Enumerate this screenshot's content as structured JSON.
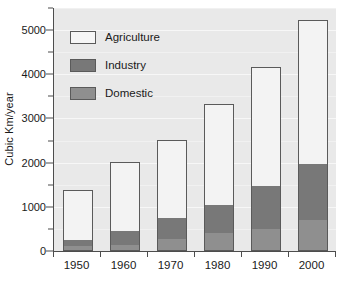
{
  "chart_data": {
    "type": "bar",
    "subtype": "stacked-bar",
    "title": "",
    "xlabel": "",
    "ylabel": "Cubic Km/year",
    "categories": [
      "1950",
      "1960",
      "1970",
      "1980",
      "1990",
      "2000"
    ],
    "series": [
      {
        "name": "Domestic",
        "color": "#8f8f8f",
        "values": [
          90,
          110,
          250,
          380,
          480,
          680
        ]
      },
      {
        "name": "Industry",
        "color": "#787878",
        "values": [
          140,
          340,
          480,
          660,
          980,
          1280
        ]
      },
      {
        "name": "Agriculture",
        "color": "#f3f3f3",
        "values": [
          1150,
          1570,
          1780,
          2290,
          2700,
          3260
        ]
      }
    ],
    "stack_order_bottom_to_top": [
      "Domestic",
      "Industry",
      "Agriculture"
    ],
    "totals": [
      1380,
      2020,
      2510,
      3330,
      4160,
      5220
    ],
    "ylim": [
      0,
      5500
    ],
    "y_major_ticks": [
      0,
      1000,
      2000,
      3000,
      4000,
      5000
    ],
    "y_minor_ticks": [
      500,
      1500,
      2500,
      3500,
      4500,
      5500
    ],
    "y_tick_labels": [
      "0",
      "1000",
      "2000",
      "3000",
      "4000",
      "5000"
    ],
    "grid": true,
    "grid_axis": "y",
    "legend_position": "top-left-inside",
    "legend_entries": [
      "Agriculture",
      "Industry",
      "Domestic"
    ],
    "plot_background": "#e9e9e9",
    "axis_color": "#4d4d4d",
    "gridline_color": "#f7f7f7"
  },
  "axes": {
    "y_title": "Cubic Km/year"
  },
  "legend": {
    "items": [
      {
        "label": "Agriculture",
        "swatch": "agriculture"
      },
      {
        "label": "Industry",
        "swatch": "industry"
      },
      {
        "label": "Domestic",
        "swatch": "domestic"
      }
    ]
  }
}
